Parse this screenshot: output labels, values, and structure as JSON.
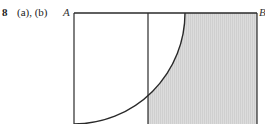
{
  "figure": {
    "number": "8",
    "parts": "(a), (b)",
    "corner_labels": {
      "top_left": "A",
      "top_right": "B"
    },
    "colors": {
      "stroke": "#2a2a2a",
      "shade": "#d9d9d9",
      "background": "#ffffff"
    }
  }
}
